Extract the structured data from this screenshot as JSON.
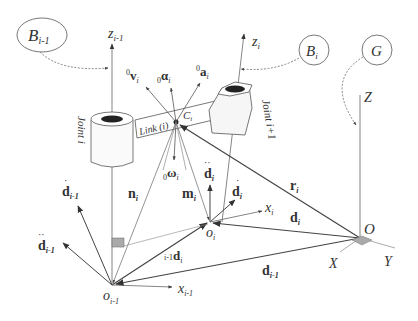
{
  "frames": {
    "B_prev": {
      "label": "B",
      "sub": "i-1"
    },
    "B_i": {
      "label": "B",
      "sub": "i"
    },
    "G": {
      "label": "G"
    }
  },
  "axes": {
    "z_prev": {
      "label": "z",
      "sub": "i-1"
    },
    "z_i": {
      "label": "z",
      "sub": "i"
    },
    "Z": "Z",
    "X": "X",
    "Y": "Y",
    "x_prev": {
      "label": "x",
      "sub": "i-1"
    },
    "x_i": {
      "label": "x",
      "sub": "i"
    }
  },
  "joints": {
    "joint_i": "Joint i",
    "joint_next": "Joint i+1"
  },
  "link": "Link (i)",
  "points": {
    "C": {
      "label": "C",
      "sub": "i"
    },
    "o_prev": {
      "label": "o",
      "sub": "i-1"
    },
    "o_i": {
      "label": "o",
      "sub": "i"
    },
    "O": "O"
  },
  "vectors": {
    "v": {
      "pre": "0",
      "label": "v",
      "sub": "i"
    },
    "alpha": {
      "pre": "0",
      "label": "α",
      "sub": "i"
    },
    "a": {
      "pre": "0",
      "label": "a",
      "sub": "i"
    },
    "omega": {
      "pre": "0",
      "label": "ω",
      "sub": "i"
    },
    "n": {
      "label": "n",
      "sub": "i"
    },
    "m": {
      "label": "m",
      "sub": "i"
    },
    "r": {
      "label": "r",
      "sub": "i"
    },
    "d_i": {
      "label": "d",
      "sub": "i"
    },
    "d_prev": {
      "label": "d",
      "sub": "i-1"
    },
    "d_rel": {
      "pre": "i-1",
      "label": "d",
      "sub": "i"
    },
    "ddot_i": {
      "label": "d",
      "sub": "i"
    },
    "dddot_i": {
      "label": "d",
      "sub": "i"
    },
    "ddot_prev": {
      "label": "d",
      "sub": "i-1"
    },
    "dddot_prev": {
      "label": "d",
      "sub": "i-1"
    }
  }
}
